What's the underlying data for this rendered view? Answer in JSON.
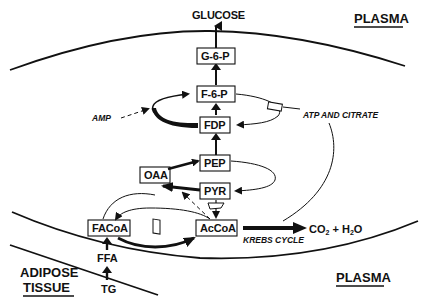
{
  "diagram": {
    "compartments": {
      "plasma_top": "PLASMA",
      "plasma_bottom": "PLASMA",
      "adipose_line1": "ADIPOSE",
      "adipose_line2": "TISSUE"
    },
    "nodes": {
      "glucose": "GLUCOSE",
      "g6p": "G-6-P",
      "f6p": "F-6-P",
      "fdp": "FDP",
      "pep": "PEP",
      "oaa": "OAA",
      "pyr": "PYR",
      "acCoA": "AcCoA",
      "faCoA": "FACoA",
      "ffa": "FFA",
      "tg": "TG",
      "co2": "CO",
      "co2_sub": "2",
      "plus": " + H",
      "h2o_sub": "2",
      "h2o_o": "O"
    },
    "annotations": {
      "amp": "AMP",
      "atp_citrate": "ATP AND CITRATE",
      "krebs": "KREBS CYCLE"
    },
    "colors": {
      "ink": "#111111",
      "background": "#ffffff"
    }
  }
}
